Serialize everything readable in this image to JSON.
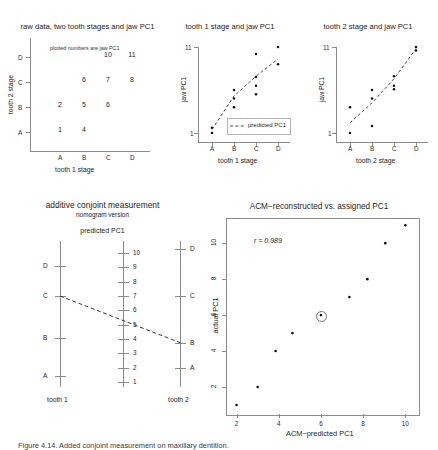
{
  "figure": {
    "caption_partial": "Figure 4.14. Added conjoint measurement on maxillary dentition."
  },
  "panel_raw": {
    "title": "raw data, two tooth stages and jaw PC1",
    "note": "plotted numbers are jaw PC1",
    "xlabel": "tooth 1 stage",
    "ylabel": "tooth 2 stage",
    "x_ticks": [
      "A",
      "B",
      "C",
      "D"
    ],
    "y_ticks": [
      "A",
      "B",
      "C",
      "D"
    ],
    "cells": [
      {
        "x": "A",
        "y": "A",
        "value": "1"
      },
      {
        "x": "B",
        "y": "A",
        "value": "4"
      },
      {
        "x": "A",
        "y": "B",
        "value": "2"
      },
      {
        "x": "B",
        "y": "B",
        "value": "5"
      },
      {
        "x": "C",
        "y": "B",
        "value": "6"
      },
      {
        "x": "B",
        "y": "C",
        "value": "6"
      },
      {
        "x": "C",
        "y": "C",
        "value": "7"
      },
      {
        "x": "D",
        "y": "C",
        "value": "8"
      },
      {
        "x": "C",
        "y": "D",
        "value": "10"
      },
      {
        "x": "D",
        "y": "D",
        "value": "11"
      }
    ]
  },
  "panel_tooth1": {
    "title": "tooth 1 stage and jaw PC1",
    "xlabel": "tooth 1 stage",
    "ylabel": "jaw PC1",
    "x_ticks": [
      "A",
      "B",
      "C",
      "D"
    ],
    "y_ticks": [
      "1",
      "11"
    ],
    "legend_label": "predicted PC1",
    "chart_data": {
      "type": "scatter",
      "x": [
        1,
        1,
        2,
        2,
        2,
        3,
        3,
        3,
        3,
        4,
        4
      ],
      "y": [
        1,
        1.6,
        4,
        5,
        6,
        5.5,
        6.5,
        7.5,
        10.2,
        9,
        11
      ],
      "predicted_x": [
        1,
        2,
        3,
        4
      ],
      "predicted_y": [
        1.4,
        5.3,
        7.6,
        9.6
      ]
    }
  },
  "panel_tooth2": {
    "title": "tooth 2 stage and jaw PC1",
    "xlabel": "tooth 2 stage",
    "ylabel": "jaw PC1",
    "x_ticks": [
      "A",
      "B",
      "C",
      "D"
    ],
    "y_ticks": [
      "1",
      "11"
    ],
    "chart_data": {
      "type": "scatter",
      "x": [
        1,
        1,
        2,
        2,
        2,
        3,
        3,
        3,
        4,
        4
      ],
      "y": [
        1,
        4,
        1.8,
        5,
        6,
        6.5,
        7.6,
        6.1,
        10.6,
        11
      ],
      "predicted_x": [
        1,
        2,
        3,
        4
      ],
      "predicted_y": [
        2.2,
        4.5,
        7.3,
        10.8
      ]
    }
  },
  "panel_nomogram": {
    "title": "additive conjoint measurement",
    "subtitle": "nomogram version",
    "scale_title": "predicted PC1",
    "left_axis_label": "tooth 1",
    "right_axis_label": "tooth 2",
    "left_ticks": [
      "A",
      "B",
      "C",
      "D"
    ],
    "right_ticks": [
      "A",
      "B",
      "C",
      "D"
    ],
    "middle_ticks": [
      "1",
      "2",
      "3",
      "4",
      "5",
      "6",
      "7",
      "8",
      "9",
      "10"
    ],
    "line_from": "C",
    "line_to": "B"
  },
  "panel_acm": {
    "title": "ACM−reconstructed vs. assigned PC1",
    "xlabel": "ACM−predicted PC1",
    "ylabel": "actual PC1",
    "annotation": "r = 0.989",
    "x_ticks": [
      "2",
      "4",
      "6",
      "8",
      "10"
    ],
    "y_ticks": [
      "2",
      "4",
      "6",
      "8",
      "10"
    ],
    "chart_data": {
      "type": "scatter",
      "x": [
        2.0,
        3.0,
        3.85,
        4.65,
        6.0,
        7.35,
        8.2,
        9.05,
        10.0
      ],
      "y": [
        1,
        2,
        4,
        5,
        6,
        7,
        8,
        10,
        11
      ],
      "xlim": [
        1.5,
        10.6
      ],
      "ylim": [
        0.5,
        11.4
      ],
      "highlighted_point": {
        "x": 6.0,
        "y": 6
      }
    }
  }
}
